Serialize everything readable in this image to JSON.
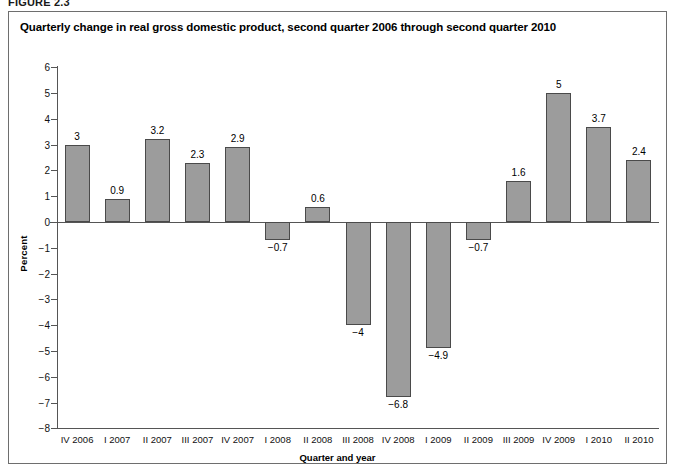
{
  "figure": {
    "caption_label": "FIGURE 2.3",
    "frame_color": "#6e6e6e",
    "background": "#ffffff"
  },
  "chart_data": {
    "type": "bar",
    "title": "Quarterly change in real gross domestic product, second quarter 2006 through second quarter 2010",
    "xlabel": "Quarter and year",
    "ylabel": "Percent",
    "categories": [
      "IV 2006",
      "I 2007",
      "II 2007",
      "III 2007",
      "IV 2007",
      "I 2008",
      "II 2008",
      "III 2008",
      "IV 2008",
      "I 2009",
      "II 2009",
      "III 2009",
      "IV 2009",
      "I 2010",
      "II 2010"
    ],
    "values": [
      3,
      0.9,
      3.2,
      2.3,
      2.9,
      -0.7,
      0.6,
      -4,
      -6.8,
      -4.9,
      -0.7,
      1.6,
      5,
      3.7,
      2.4
    ],
    "value_labels": [
      "3",
      "0.9",
      "3.2",
      "2.3",
      "2.9",
      "−0.7",
      "0.6",
      "−4",
      "−6.8",
      "−4.9",
      "−0.7",
      "1.6",
      "5",
      "3.7",
      "2.4"
    ],
    "ylim": [
      -8,
      6
    ],
    "ytick_values": [
      6,
      5,
      4,
      3,
      2,
      1,
      0,
      -1,
      -2,
      -3,
      -4,
      -5,
      -6,
      -7,
      -8
    ],
    "ytick_labels": [
      "6",
      "5",
      "4",
      "3",
      "2",
      "1",
      "0",
      "−1",
      "−2",
      "−3",
      "−4",
      "−5",
      "−6",
      "−7",
      "−8"
    ],
    "grid": false,
    "legend": null,
    "bar_fill": "#9c9c9c",
    "bar_edge": "#4a4a4a",
    "axis_color": "#555555"
  }
}
